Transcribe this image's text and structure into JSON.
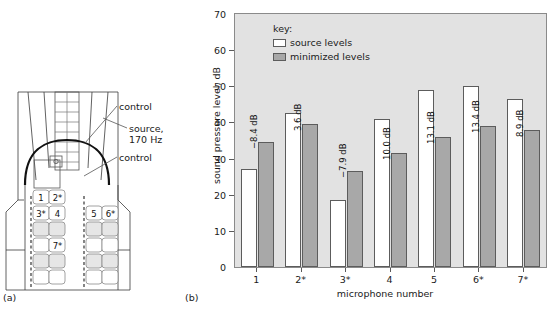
{
  "figure": {
    "panel_a_caption": "(a)",
    "panel_b_caption": "(b)"
  },
  "diagram": {
    "annotations": [
      {
        "name": "control-upper",
        "text": "control"
      },
      {
        "name": "source",
        "line1": "source,",
        "line2": "170 Hz"
      },
      {
        "name": "control-lower",
        "text": "control"
      }
    ],
    "seat_labels": [
      "1",
      "2*",
      "3*",
      "4",
      "5",
      "6*",
      "7*"
    ]
  },
  "chart_data": {
    "type": "bar",
    "title": "",
    "xlabel": "microphone number",
    "ylabel": "sound pressure level, dB",
    "categories": [
      "1",
      "2*",
      "3*",
      "4",
      "5",
      "6*",
      "7*"
    ],
    "ylim": [
      0,
      70
    ],
    "yticks": [
      0,
      10,
      20,
      30,
      40,
      50,
      60,
      70
    ],
    "grid": false,
    "legend_title": "key:",
    "legend_position": "top-left",
    "series": [
      {
        "name": "source levels",
        "color": "#ffffff",
        "values": [
          27.0,
          42.5,
          18.5,
          41.0,
          49.0,
          50.0,
          46.5
        ]
      },
      {
        "name": "minimized levels",
        "color": "#a8a8a8",
        "values": [
          34.5,
          39.5,
          26.5,
          31.5,
          36.0,
          39.0,
          38.0
        ]
      }
    ],
    "annotations": [
      {
        "category": "1",
        "text": "−8.4 dB"
      },
      {
        "category": "2*",
        "text": "3.6 dB"
      },
      {
        "category": "3*",
        "text": "−7.9 dB"
      },
      {
        "category": "4",
        "text": "10.0 dB"
      },
      {
        "category": "5",
        "text": "13.1 dB"
      },
      {
        "category": "6*",
        "text": "13.4 dB"
      },
      {
        "category": "7*",
        "text": "8.9 dB"
      }
    ]
  }
}
